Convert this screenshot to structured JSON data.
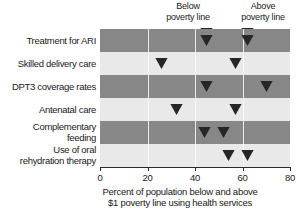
{
  "chart_data": {
    "type": "scatter",
    "title": "",
    "xlabel": "Percent of population below and above $1 poverty line using health services",
    "xlabel_lines": [
      "Percent of population below and above",
      "$1 poverty line using health services"
    ],
    "ylabel": "",
    "xlim": [
      0,
      80
    ],
    "xticks": [
      0,
      20,
      40,
      60,
      80
    ],
    "xtick_labels": [
      "0",
      "20",
      "40",
      "60",
      "80"
    ],
    "grid": true,
    "legend_position": "top",
    "categories": [
      "Treatment for ARI",
      "Skilled delivery care",
      "DPT3 coverage rates",
      "Antenatal care",
      "Complementary feeding",
      "Use of oral rehydration therapy"
    ],
    "category_lines": [
      [
        "Treatment for ARI"
      ],
      [
        "Skilled delivery care"
      ],
      [
        "DPT3 coverage rates"
      ],
      [
        "Antenatal care"
      ],
      [
        "Complementary",
        "feeding"
      ],
      [
        "Use of oral",
        "rehydration therapy"
      ]
    ],
    "series": [
      {
        "name": "Below poverty line",
        "values": [
          45,
          26,
          45,
          32,
          44,
          54
        ]
      },
      {
        "name": "Above poverty line",
        "values": [
          62,
          57,
          70,
          57,
          52,
          62
        ]
      }
    ],
    "marker": "down-arrow",
    "colors": {
      "band_dark": "#878787",
      "band_light": "#e9e9e9",
      "marker": "#262626",
      "gridline": "#fdfdfd",
      "axis": "#2a2a2a",
      "text": "#1a1a1a",
      "background": "#ffffff"
    }
  },
  "legend": {
    "below": {
      "lines": [
        "Below",
        "poverty line"
      ],
      "marker_x_value": 45
    },
    "above": {
      "lines": [
        "Above",
        "poverty line"
      ],
      "marker_x_value": 62
    }
  }
}
